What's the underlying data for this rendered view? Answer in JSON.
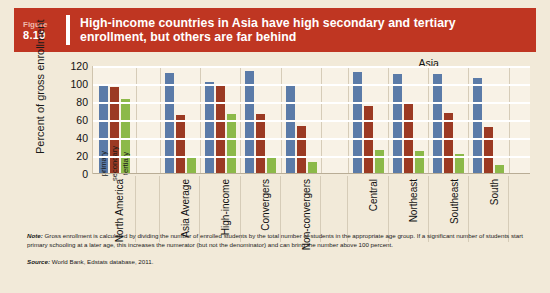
{
  "header": {
    "figure_word": "Figure",
    "figure_number": "8.10",
    "title": "High-income countries in Asia have high secondary and tertiary enrollment, but others are far behind",
    "accent_color": "#bf3622"
  },
  "footer": {
    "note_label": "Note:",
    "note_text": " Gross enrollment is calculated by dividing the number of enrolled students by the total number of students in the appropriate age group. If a significant number of students start primary schooling at a later age, this increases the numerator (but not the denominator) and can bring the number above 100 percent.",
    "source_label": "Source:",
    "source_text": " World Bank, Edstats database, 2011."
  },
  "chart_data": {
    "type": "bar",
    "title": "High-income countries in Asia have high secondary and tertiary enrollment, but others are far behind",
    "xlabel": "",
    "ylabel": "Percent of gross enrollment",
    "ylim": [
      0,
      120
    ],
    "yticks": [
      120,
      100,
      80,
      60,
      40,
      20,
      0
    ],
    "grid": true,
    "legend_position": "inside-first-group",
    "annotations": [
      {
        "text": "Asia",
        "over_categories": [
          "Central",
          "Northeast",
          "Southeast",
          "South"
        ]
      }
    ],
    "categories": [
      "North America",
      "Asia Average",
      "High-income",
      "Convergers",
      "Non-convergers",
      "Central",
      "Northeast",
      "Southeast",
      "South"
    ],
    "series": [
      {
        "name": "primary",
        "color": "#5b7ba8",
        "values": [
          100,
          112,
          102,
          114,
          100,
          113,
          111,
          111,
          107
        ]
      },
      {
        "name": "secondary",
        "color": "#9b3a23",
        "values": [
          97,
          66,
          100,
          67,
          53,
          76,
          78,
          68,
          52
        ]
      },
      {
        "name": "tertiary",
        "color": "#8cb949",
        "values": [
          83,
          20,
          67,
          18,
          13,
          27,
          26,
          22,
          10
        ]
      }
    ]
  },
  "colors": {
    "page_background": "#f2ead9",
    "plot_background": "#f8f2e6",
    "gridline": "#ffffff"
  }
}
